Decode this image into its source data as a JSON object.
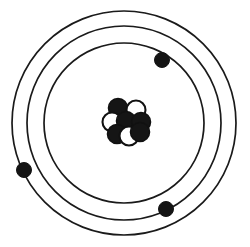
{
  "figure": {
    "background_color": "#ffffff",
    "line_color": "#1a1a1a",
    "width": 250,
    "height": 247
  },
  "diagram": {
    "type": "bohr-atom-model",
    "center": {
      "x": 124,
      "y": 123
    },
    "orbits": [
      {
        "name": "outer-orbit",
        "shell": "3",
        "radius": 112,
        "stroke_width": 1.7,
        "color": "#1a1a1a"
      },
      {
        "name": "middle-orbit",
        "shell": "2",
        "radius": 97,
        "stroke_width": 1.7,
        "color": "#1a1a1a"
      },
      {
        "name": "inner-orbit",
        "shell": "1",
        "radius": 80,
        "stroke_width": 1.7,
        "color": "#1a1a1a"
      }
    ],
    "electrons": [
      {
        "name": "electron-top-right",
        "x": 162,
        "y": 60,
        "r": 7.5,
        "orbit": "inner-orbit",
        "color": "#141414"
      },
      {
        "name": "electron-left",
        "x": 24,
        "y": 170,
        "r": 7.5,
        "orbit": "outer-orbit",
        "color": "#141414"
      },
      {
        "name": "electron-bottom-right",
        "x": 166,
        "y": 209,
        "r": 7.5,
        "orbit": "middle-orbit",
        "color": "#141414"
      }
    ],
    "nucleus": {
      "name": "nucleus",
      "center": {
        "x": 126,
        "y": 122
      },
      "particle_radius": 9.5,
      "proton_color": "#151515",
      "neutron_fill": "#ffffff",
      "neutron_stroke": "#151515",
      "particles": [
        {
          "name": "proton-upper-left",
          "type": "proton",
          "x": 118,
          "y": 108
        },
        {
          "name": "neutron-upper-right",
          "type": "neutron",
          "x": 136,
          "y": 110
        },
        {
          "name": "neutron-left",
          "type": "neutron",
          "x": 112,
          "y": 122
        },
        {
          "name": "proton-center",
          "type": "proton",
          "x": 126,
          "y": 121
        },
        {
          "name": "proton-right",
          "type": "proton",
          "x": 141,
          "y": 122
        },
        {
          "name": "proton-lower-left",
          "type": "proton",
          "x": 117,
          "y": 134
        },
        {
          "name": "neutron-lower-mid",
          "type": "neutron",
          "x": 129,
          "y": 136
        },
        {
          "name": "proton-lower-right",
          "type": "proton",
          "x": 140,
          "y": 132
        }
      ]
    }
  }
}
